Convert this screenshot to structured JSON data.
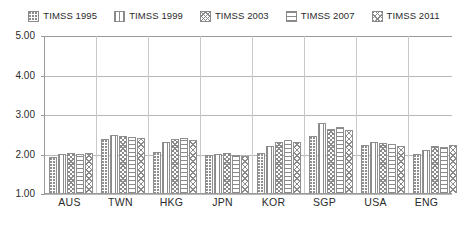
{
  "chart_data": {
    "type": "bar",
    "title": "",
    "subtitle": "",
    "xlabel": "",
    "ylabel": "",
    "ylim": [
      1.0,
      5.0
    ],
    "ytick_labels": [
      "5.00",
      "4.00",
      "3.00",
      "2.00",
      "1.00"
    ],
    "ytick_values": [
      5.0,
      4.0,
      3.0,
      2.0,
      1.0
    ],
    "grid": true,
    "legend_position": "top",
    "categories": [
      "AUS",
      "TWN",
      "HKG",
      "JPN",
      "KOR",
      "SGP",
      "USA",
      "ENG"
    ],
    "series": [
      {
        "name": "TIMSS 1995",
        "pattern": "dots",
        "values": [
          1.92,
          2.38,
          2.05,
          1.95,
          2.02,
          2.45,
          2.22,
          2.0
        ]
      },
      {
        "name": "TIMSS 1999",
        "pattern": "vertical-dash",
        "values": [
          2.0,
          2.46,
          2.3,
          2.0,
          2.18,
          2.78,
          2.3,
          2.1
        ]
      },
      {
        "name": "TIMSS 2003",
        "pattern": "wave",
        "values": [
          2.02,
          2.44,
          2.36,
          2.02,
          2.3,
          2.62,
          2.26,
          2.2
        ]
      },
      {
        "name": "TIMSS 2007",
        "pattern": "horizontal",
        "values": [
          2.0,
          2.42,
          2.4,
          1.96,
          2.34,
          2.66,
          2.24,
          2.16
        ]
      },
      {
        "name": "TIMSS 2011",
        "pattern": "cross",
        "values": [
          2.02,
          2.4,
          2.34,
          1.94,
          2.28,
          2.6,
          2.2,
          2.22
        ]
      }
    ]
  },
  "legend": {
    "items": [
      {
        "label": "TIMSS 1995",
        "swatch": "legend-swatch-dots"
      },
      {
        "label": "TIMSS 1999",
        "swatch": "legend-swatch-vertical"
      },
      {
        "label": "TIMSS 2003",
        "swatch": "legend-swatch-wave"
      },
      {
        "label": "TIMSS 2007",
        "swatch": "legend-swatch-horizontal"
      },
      {
        "label": "TIMSS 2011",
        "swatch": "legend-swatch-cross"
      }
    ]
  },
  "colors": {
    "background": "#ffffff",
    "axis": "#9a9a9a",
    "gridline": "#b8b8b8",
    "bar_outline": "#8f8f8f",
    "bar_fill": "#ffffff",
    "text": "#2b2b2b"
  }
}
